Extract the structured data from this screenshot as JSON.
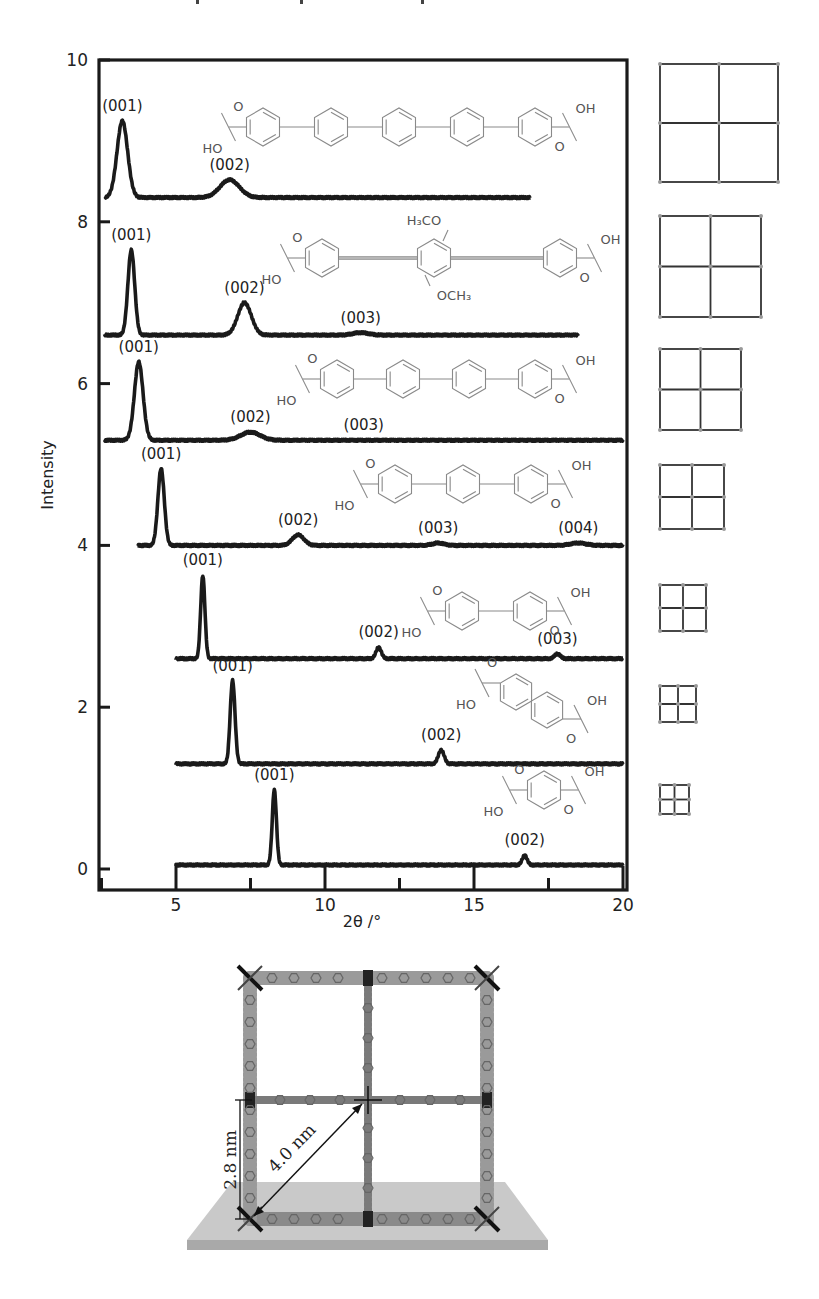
{
  "header": {
    "cropped_caption_text": "… p … p … g"
  },
  "chart_data": {
    "type": "line",
    "title": "",
    "xlabel": "2θ /°",
    "ylabel": "Intensity",
    "xlim": [
      2.5,
      20
    ],
    "ylim": [
      0,
      10
    ],
    "x_ticks": [
      5,
      10,
      15,
      20
    ],
    "x_minor_ticks": [
      2.5,
      7.5,
      12.5,
      17.5
    ],
    "y_ticks": [
      0,
      2,
      4,
      6,
      8,
      10
    ],
    "grid": false,
    "legend": "none (series identified by inline molecular structures and lattice icons on the right)",
    "series": [
      {
        "name": "sexiphenyl dicarboxylic acid (6 rings)",
        "baseline": 8.3,
        "x_start": 2.6,
        "x_end": 16.9,
        "peaks": [
          {
            "label": "(001)",
            "x": 3.2,
            "height": 0.95,
            "width": 0.55
          },
          {
            "label": "(002)",
            "x": 6.8,
            "height": 0.22,
            "width": 1.0
          }
        ],
        "lattice_icon_size_px": 118
      },
      {
        "name": "dimethoxy bis(phenylethynyl)benzene dicarboxylic acid",
        "baseline": 6.6,
        "x_start": 2.6,
        "x_end": 18.5,
        "peaks": [
          {
            "label": "(001)",
            "x": 3.5,
            "height": 1.05,
            "width": 0.35
          },
          {
            "label": "(002)",
            "x": 7.3,
            "height": 0.4,
            "width": 0.7
          },
          {
            "label": "(003)",
            "x": 11.2,
            "height": 0.03,
            "width": 0.8
          }
        ],
        "lattice_icon_size_px": 101
      },
      {
        "name": "quinquephenyl dicarboxylic acid (5 rings)",
        "baseline": 5.3,
        "x_start": 2.6,
        "x_end": 20.0,
        "peaks": [
          {
            "label": "(001)",
            "x": 3.75,
            "height": 0.97,
            "width": 0.45
          },
          {
            "label": "(002)",
            "x": 7.5,
            "height": 0.1,
            "width": 1.0
          },
          {
            "label": "(003)",
            "x": 11.3,
            "height": 0.0,
            "width": 1.0
          }
        ],
        "lattice_icon_size_px": 81
      },
      {
        "name": "terphenyl dicarboxylic acid (3 rings... 4 rings drawn)",
        "baseline": 4.0,
        "x_start": 3.7,
        "x_end": 20.0,
        "peaks": [
          {
            "label": "(001)",
            "x": 4.5,
            "height": 0.95,
            "width": 0.33
          },
          {
            "label": "(002)",
            "x": 9.1,
            "height": 0.13,
            "width": 0.6
          },
          {
            "label": "(003)",
            "x": 13.8,
            "height": 0.03,
            "width": 0.6
          },
          {
            "label": "(004)",
            "x": 18.5,
            "height": 0.03,
            "width": 0.8
          }
        ],
        "lattice_icon_size_px": 64
      },
      {
        "name": "biphenyl dicarboxylic acid",
        "baseline": 2.6,
        "x_start": 5.0,
        "x_end": 20.0,
        "peaks": [
          {
            "label": "(001)",
            "x": 5.9,
            "height": 1.03,
            "width": 0.22
          },
          {
            "label": "(002)",
            "x": 11.8,
            "height": 0.14,
            "width": 0.28
          },
          {
            "label": "(003)",
            "x": 17.8,
            "height": 0.06,
            "width": 0.3
          }
        ],
        "lattice_icon_size_px": 46
      },
      {
        "name": "naphthalene dicarboxylic acid",
        "baseline": 1.3,
        "x_start": 5.0,
        "x_end": 20.0,
        "peaks": [
          {
            "label": "(001)",
            "x": 6.9,
            "height": 1.03,
            "width": 0.25
          },
          {
            "label": "(002)",
            "x": 13.9,
            "height": 0.17,
            "width": 0.3
          }
        ],
        "lattice_icon_size_px": 36
      },
      {
        "name": "terephthalic acid (1 ring)",
        "baseline": 0.05,
        "x_start": 5.0,
        "x_end": 20.0,
        "peaks": [
          {
            "label": "(001)",
            "x": 8.3,
            "height": 0.93,
            "width": 0.22
          },
          {
            "label": "(002)",
            "x": 16.7,
            "height": 0.12,
            "width": 0.25
          }
        ],
        "lattice_icon_size_px": 29
      }
    ]
  },
  "molecules": {
    "labels": {
      "carboxyl_top_o": "O",
      "carboxyl_bottom_ho": "HO",
      "carboxyl_top_oh": "OH",
      "carboxyl_bottom_o": "O",
      "methoxy_top": "H₃CO",
      "methoxy_bottom": "OCH₃"
    }
  },
  "illustration": {
    "height_label": "2.8 nm",
    "diagonal_label": "4.0 nm"
  }
}
